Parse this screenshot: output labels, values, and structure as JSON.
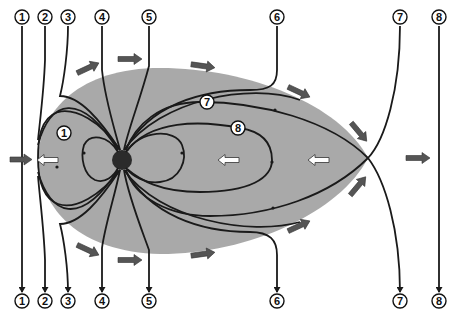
{
  "diagram": {
    "colors": {
      "background": "#ffffff",
      "magnetosphere": "#a9a9a9",
      "field_line": "#1a1a1a",
      "earth": "#2b2b2b",
      "flow_arrow": "#555555",
      "convection_arrow_fill": "#ffffff"
    },
    "top_labels": [
      {
        "id": "1",
        "text": "1",
        "x": 22
      },
      {
        "id": "2",
        "text": "2",
        "x": 45
      },
      {
        "id": "3",
        "text": "3",
        "x": 68
      },
      {
        "id": "4",
        "text": "4",
        "x": 102
      },
      {
        "id": "5",
        "text": "5",
        "x": 149
      },
      {
        "id": "6",
        "text": "6",
        "x": 277
      },
      {
        "id": "7",
        "text": "7",
        "x": 400
      },
      {
        "id": "8",
        "text": "8",
        "x": 439
      }
    ],
    "bottom_labels": [
      {
        "id": "1",
        "text": "1",
        "x": 22
      },
      {
        "id": "2",
        "text": "2",
        "x": 45
      },
      {
        "id": "3",
        "text": "3",
        "x": 68
      },
      {
        "id": "4",
        "text": "4",
        "x": 102
      },
      {
        "id": "5",
        "text": "5",
        "x": 149
      },
      {
        "id": "6",
        "text": "6",
        "x": 277
      },
      {
        "id": "7",
        "text": "7",
        "x": 400
      },
      {
        "id": "8",
        "text": "8",
        "x": 439
      }
    ],
    "inner_labels": [
      {
        "id": "1",
        "text": "1",
        "x": 64,
        "y": 133
      },
      {
        "id": "7",
        "text": "7",
        "x": 207,
        "y": 102
      },
      {
        "id": "8",
        "text": "8",
        "x": 238,
        "y": 128
      }
    ],
    "earth": {
      "cx": 122,
      "cy": 160,
      "r": 10
    },
    "x_point": {
      "x": 368,
      "y": 158
    }
  }
}
